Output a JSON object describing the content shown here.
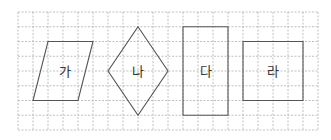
{
  "grid": {
    "x0": 18,
    "y0": 12,
    "cols": 20,
    "rows": 8,
    "cell_w": 15,
    "cell_h": 14.75,
    "line_color": "#b0b0b0"
  },
  "shapes": [
    {
      "id": "ga",
      "label": "가",
      "type": "parallelogram",
      "points_grid": [
        [
          2,
          2
        ],
        [
          5,
          2
        ],
        [
          4,
          6
        ],
        [
          1,
          6
        ]
      ],
      "label_pos": [
        3.1,
        4
      ]
    },
    {
      "id": "na",
      "label": "나",
      "type": "rhombus",
      "points_grid": [
        [
          8,
          1
        ],
        [
          10,
          4
        ],
        [
          8,
          7
        ],
        [
          6,
          4
        ]
      ],
      "label_pos": [
        8,
        4
      ]
    },
    {
      "id": "da",
      "label": "다",
      "type": "rectangle",
      "points_grid": [
        [
          11,
          1
        ],
        [
          14,
          1
        ],
        [
          14,
          7
        ],
        [
          11,
          7
        ]
      ],
      "label_pos": [
        12.5,
        4
      ]
    },
    {
      "id": "ra",
      "label": "라",
      "type": "square",
      "points_grid": [
        [
          15,
          2
        ],
        [
          19,
          2
        ],
        [
          19,
          6
        ],
        [
          15,
          6
        ]
      ],
      "label_pos": [
        17,
        4
      ]
    }
  ],
  "shape_stroke": "#555555"
}
